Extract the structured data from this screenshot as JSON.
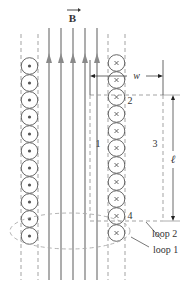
{
  "figure": {
    "field_label": "B",
    "field_direction": "up",
    "field_line_count": 5,
    "width_label": "w",
    "length_label": "ℓ",
    "path_labels": [
      "1",
      "2",
      "3",
      "4"
    ],
    "loop_labels": {
      "loop1": "loop 1",
      "loop2": "loop 2"
    },
    "left_column": {
      "current_symbol": "dot",
      "meaning": "current out of page",
      "wire_count": 11
    },
    "right_column": {
      "current_symbol": "cross",
      "meaning": "current into page",
      "wire_count": 11
    },
    "colors": {
      "field_line": "#8a8a8a",
      "outline": "#555555",
      "dashed": "#999999",
      "text": "#333333"
    }
  }
}
